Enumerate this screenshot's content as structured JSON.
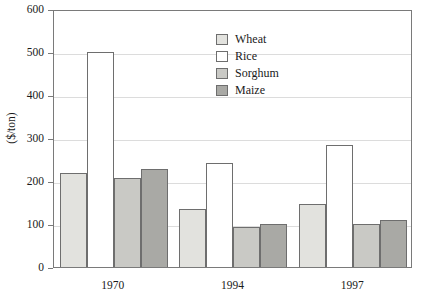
{
  "chart_data": {
    "type": "bar",
    "title": "",
    "xlabel": "",
    "ylabel": "($/ton)",
    "ylim": [
      0,
      600
    ],
    "yticks": [
      0,
      100,
      200,
      300,
      400,
      500,
      600
    ],
    "ytick_labels": [
      "0",
      "100",
      "200",
      "300",
      "400",
      "500",
      "600"
    ],
    "grid": true,
    "legend_position": "upper-center-right",
    "categories": [
      "1970",
      "1994",
      "1997"
    ],
    "series": [
      {
        "name": "Wheat",
        "color": "#e2e2de",
        "values": [
          218,
          136,
          147
        ]
      },
      {
        "name": "Rice",
        "color": "#ffffff",
        "values": [
          500,
          243,
          283
        ]
      },
      {
        "name": "Sorghum",
        "color": "#c9c9c5",
        "values": [
          207,
          93,
          100
        ]
      },
      {
        "name": "Maize",
        "color": "#a9a9a5",
        "values": [
          228,
          100,
          110
        ]
      }
    ]
  },
  "axes": {
    "frame_color": "#7a7a7a",
    "grid_color": "#dcdcdc",
    "bar_edge_color": "#6e6e6e"
  }
}
